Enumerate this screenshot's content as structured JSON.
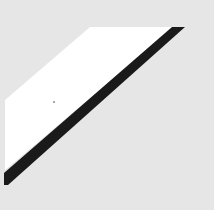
{
  "image": {
    "description": "Abstract graphic: white parallelogram above a black diagonal stripe on light gray background",
    "colors": {
      "background": "#e6e6e6",
      "highlight": "#ffffff",
      "stripe": "#1a1a1a",
      "speck": "#888888"
    }
  }
}
